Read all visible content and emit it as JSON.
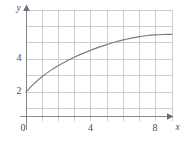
{
  "figure": {
    "background_color": "#ffffff",
    "grid_color": "#b9b9b9",
    "axis_color": "#7d7d7d",
    "curve_color": "#7b7b7b",
    "label_color": "#4c4c4c",
    "x_axis_name": "x",
    "y_axis_name": "y",
    "origin_label": "0"
  },
  "chart_data": {
    "type": "line",
    "title": "",
    "subtitle": "",
    "xlabel": "x",
    "ylabel": "y",
    "xlim": [
      0,
      9
    ],
    "ylim": [
      0,
      7
    ],
    "xticks": [
      0,
      4,
      8
    ],
    "xtick_labels": [
      "0",
      "4",
      "8"
    ],
    "yticks": [
      2,
      4
    ],
    "ytick_labels": [
      "2",
      "4"
    ],
    "grid": true,
    "grid_x_step": 1,
    "grid_y_step": 1,
    "legend": false,
    "legend_position": "none",
    "annotations": [],
    "series": [
      {
        "name": "curve",
        "x": [
          0.0,
          0.25,
          0.5,
          0.75,
          1.0,
          1.5,
          2.0,
          2.5,
          3.0,
          3.5,
          4.0,
          4.5,
          5.0,
          5.5,
          6.0,
          6.5,
          7.0,
          7.5,
          8.0,
          8.5,
          9.0
        ],
        "y": [
          2.0,
          2.27,
          2.52,
          2.74,
          2.95,
          3.31,
          3.62,
          3.89,
          4.14,
          4.36,
          4.56,
          4.74,
          4.9,
          5.05,
          5.18,
          5.29,
          5.38,
          5.45,
          5.49,
          5.51,
          5.52
        ]
      }
    ]
  },
  "ticks": {
    "x": [
      {
        "label": "0",
        "value": 0
      },
      {
        "label": "4",
        "value": 4
      },
      {
        "label": "8",
        "value": 8
      }
    ],
    "y": [
      {
        "label": "2",
        "value": 2
      },
      {
        "label": "4",
        "value": 4
      }
    ]
  }
}
